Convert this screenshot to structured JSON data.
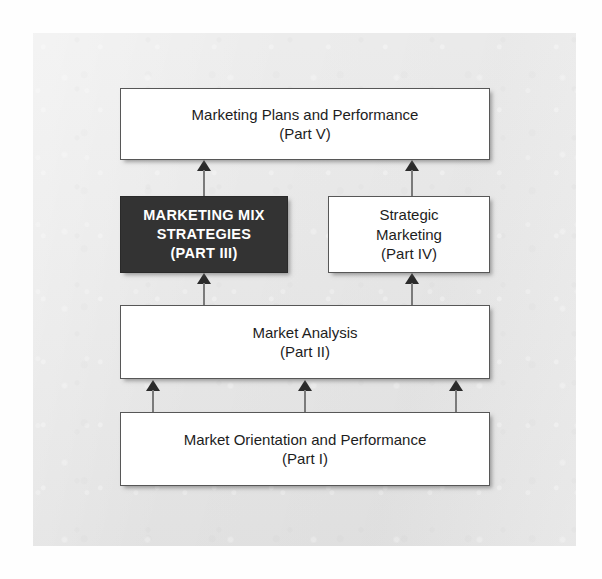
{
  "diagram": {
    "type": "hierarchy-flow",
    "nodes": [
      {
        "id": "plans",
        "line1": "Marketing Plans and Performance",
        "line2": "(Part V)",
        "style": "light",
        "level": 1
      },
      {
        "id": "marketing-mix",
        "line1": "MARKETING MIX",
        "line2": "STRATEGIES",
        "line3": "(PART III)",
        "style": "dark",
        "level": 2
      },
      {
        "id": "strategic-marketing",
        "line1": "Strategic",
        "line2": "Marketing",
        "line3": "(Part IV)",
        "style": "light",
        "level": 2
      },
      {
        "id": "market-analysis",
        "line1": "Market Analysis",
        "line2": "(Part II)",
        "style": "light",
        "level": 3
      },
      {
        "id": "market-orientation",
        "line1": "Market Orientation and Performance",
        "line2": "(Part I)",
        "style": "light",
        "level": 4
      }
    ],
    "connectors": [
      {
        "id": "mix-to-plans",
        "from": "marketing-mix",
        "to": "plans",
        "direction": "up"
      },
      {
        "id": "strategic-to-plans",
        "from": "strategic-marketing",
        "to": "plans",
        "direction": "up"
      },
      {
        "id": "analysis-to-mix",
        "from": "market-analysis",
        "to": "marketing-mix",
        "direction": "up"
      },
      {
        "id": "analysis-to-strategic",
        "from": "market-analysis",
        "to": "strategic-marketing",
        "direction": "up"
      },
      {
        "id": "orientation-to-analysis-left",
        "from": "market-orientation",
        "to": "market-analysis",
        "direction": "up"
      },
      {
        "id": "orientation-to-analysis-center",
        "from": "market-orientation",
        "to": "market-analysis",
        "direction": "up"
      },
      {
        "id": "orientation-to-analysis-right",
        "from": "market-orientation",
        "to": "market-analysis",
        "direction": "up"
      }
    ],
    "colors": {
      "panel_background": "#e6e6e6",
      "box_fill_light": "#ffffff",
      "box_fill_dark": "#333333",
      "box_border": "#575757",
      "text_light": "#1d1d1d",
      "text_dark": "#ffffff",
      "arrow_shaft": "#7b7b7b",
      "arrow_head": "#2b2b2b"
    }
  }
}
